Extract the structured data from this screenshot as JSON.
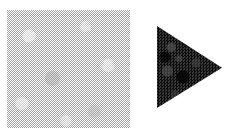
{
  "canvas": {
    "width": 237,
    "height": 133,
    "background_color": "#ffffff",
    "caption": ""
  },
  "shapes": [
    {
      "id": "square",
      "icon_name": "filled-square-shape",
      "label": "",
      "form": "square",
      "texture": "halftone-dither",
      "fill_color": "#c2c2c2",
      "tone": "light gray",
      "x": 7,
      "y": 10,
      "width": 123,
      "height": 118
    },
    {
      "id": "triangle",
      "icon_name": "filled-triangle-shape",
      "label": "",
      "form": "triangle",
      "orientation": "pointing-right",
      "texture": "granular-noise",
      "fill_color": "#232323",
      "tone": "near black",
      "x": 157,
      "y": 26,
      "width": 65,
      "height": 82,
      "vertices": [
        [
          157,
          26
        ],
        [
          222,
          68
        ],
        [
          157,
          108
        ]
      ]
    }
  ]
}
